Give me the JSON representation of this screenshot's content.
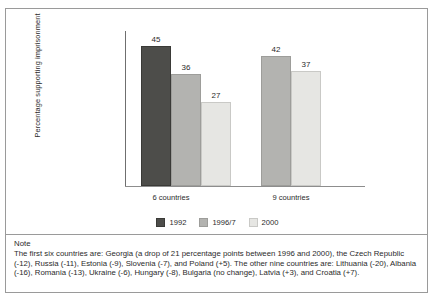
{
  "chart_data": {
    "type": "bar",
    "title": "",
    "xlabel": "",
    "ylabel": "Percentage supporting imprisonment",
    "ylim": [
      0,
      50
    ],
    "grid": false,
    "legend_position": "bottom-center",
    "categories": [
      "6 countries",
      "9 countries"
    ],
    "series": [
      {
        "name": "1992",
        "color": "#4d4d4a",
        "values": [
          45,
          null
        ]
      },
      {
        "name": "1996/7",
        "color": "#b3b3b0",
        "values": [
          36,
          42
        ]
      },
      {
        "name": "2000",
        "color": "#e6e6e3",
        "values": [
          27,
          37
        ]
      }
    ],
    "bars": [
      {
        "group": "6 countries",
        "series": "1992",
        "value": 45,
        "label": "45"
      },
      {
        "group": "6 countries",
        "series": "1996/7",
        "value": 36,
        "label": "36"
      },
      {
        "group": "6 countries",
        "series": "2000",
        "value": 27,
        "label": "27"
      },
      {
        "group": "9 countries",
        "series": "1996/7",
        "value": 42,
        "label": "42"
      },
      {
        "group": "9 countries",
        "series": "2000",
        "value": 37,
        "label": "37"
      }
    ]
  },
  "legend": {
    "entries": [
      {
        "label": "1992",
        "swatch": "dark"
      },
      {
        "label": "1996/7",
        "swatch": "mid"
      },
      {
        "label": "2000",
        "swatch": "light"
      }
    ]
  },
  "note": {
    "heading": "Note",
    "body": "The first six countries are: Georgia (a drop of 21 percentage points between 1996 and 2000), the Czech Republic (-12), Russia (-11), Estonia (-9), Slovenia (-7), and Poland (+5). The other nine countries are: Lithuania (-20), Albania (-16), Romania (-13), Ukraine (-6), Hungary (-8), Bulgaria (no change), Latvia (+3), and Croatia (+7)."
  }
}
